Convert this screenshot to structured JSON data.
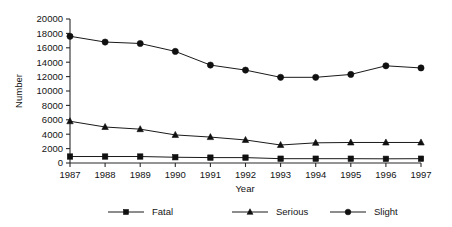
{
  "chart_data": {
    "type": "line",
    "title": "",
    "subtitle": "",
    "xlabel": "Year",
    "ylabel": "Number",
    "categories": [
      "1987",
      "1988",
      "1989",
      "1990",
      "1991",
      "1992",
      "1993",
      "1994",
      "1995",
      "1996",
      "1997"
    ],
    "x": [
      1987,
      1988,
      1989,
      1990,
      1991,
      1992,
      1993,
      1994,
      1995,
      1996,
      1997
    ],
    "xlim": [
      1987,
      1997
    ],
    "ylim": [
      0,
      20000
    ],
    "ytick_values": [
      0,
      2000,
      4000,
      6000,
      8000,
      10000,
      12000,
      14000,
      16000,
      18000,
      20000
    ],
    "ytick_labels": [
      "0",
      "2000",
      "4000",
      "6000",
      "8000",
      "10000",
      "12000",
      "14000",
      "16000",
      "18000",
      "20000"
    ],
    "grid": false,
    "legend_position": "bottom",
    "series": [
      {
        "name": "Fatal",
        "marker": "square",
        "color": "#101010",
        "values": [
          900,
          900,
          900,
          800,
          750,
          750,
          600,
          600,
          600,
          580,
          600
        ]
      },
      {
        "name": "Serious",
        "marker": "triangle",
        "color": "#101010",
        "values": [
          5800,
          5000,
          4700,
          3900,
          3600,
          3200,
          2500,
          2800,
          2850,
          2850,
          2850
        ]
      },
      {
        "name": "Slight",
        "marker": "circle",
        "color": "#101010",
        "values": [
          17600,
          16800,
          16600,
          15500,
          13600,
          12900,
          11900,
          11900,
          12300,
          13500,
          13200
        ]
      }
    ]
  },
  "axes": {
    "y_axis_title": "Number",
    "x_axis_title": "Year"
  },
  "legend": {
    "items": [
      {
        "label": "Fatal",
        "marker": "square"
      },
      {
        "label": "Serious",
        "marker": "triangle"
      },
      {
        "label": "Slight",
        "marker": "circle"
      }
    ]
  }
}
